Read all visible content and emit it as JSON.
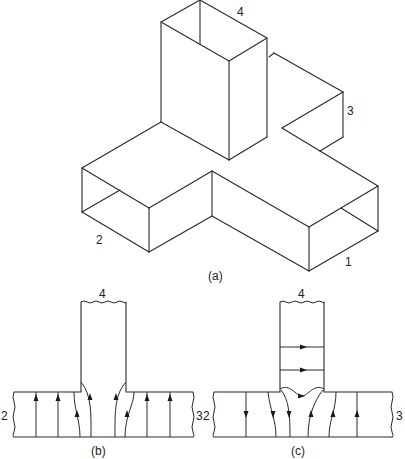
{
  "figure": {
    "part_a": {
      "caption": "(a)",
      "port_labels": {
        "p1": "1",
        "p2": "2",
        "p3": "3",
        "p4": "4"
      },
      "description": "Isometric view of rectangular waveguide magic-T junction"
    },
    "part_b": {
      "caption": "(b)",
      "port_labels": {
        "top": "4",
        "left": "2",
        "right": "3"
      },
      "description": "E-field lines in H-plane cross-section, input at port 1"
    },
    "part_c": {
      "caption": "(c)",
      "port_labels": {
        "top": "4",
        "left": "2",
        "right": "3"
      },
      "description": "E-field lines in H-plane cross-section, input at port 4"
    }
  }
}
